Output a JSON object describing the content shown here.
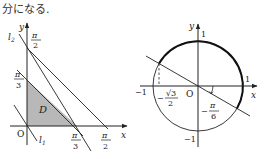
{
  "caption": "分になる.",
  "left_diagram": {
    "axis_x_label": "x",
    "axis_y_label": "y",
    "origin_label": "O",
    "line_labels": {
      "l1": "l",
      "l1_sub": "1",
      "l2": "l",
      "l2_sub": "2"
    },
    "region_label": "D",
    "y_ticks": [
      {
        "num": "π",
        "den": "2"
      },
      {
        "num": "π",
        "den": "3"
      }
    ],
    "x_ticks": [
      {
        "num": "π",
        "den": "3"
      },
      {
        "num": "π",
        "den": "2"
      }
    ],
    "shade_color": "#b8b8b8"
  },
  "right_diagram": {
    "axis_x_label": "x",
    "axis_y_label": "y",
    "origin_label": "O",
    "tick_labels": {
      "y_top": "1",
      "y_bottom": "−1",
      "x_right": "1",
      "x_left": "−1"
    },
    "sqrt_label": {
      "sign": "−",
      "num": "√3",
      "den": "2"
    },
    "angle_label": {
      "sign": "−",
      "num": "π",
      "den": "6"
    }
  }
}
